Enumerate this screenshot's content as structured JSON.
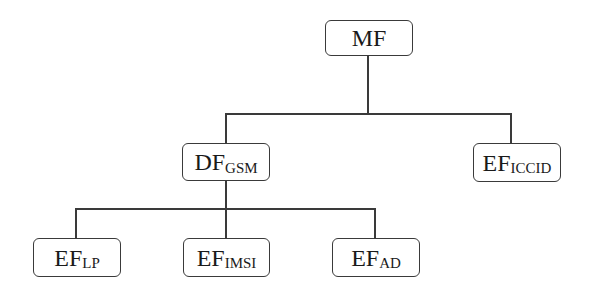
{
  "diagram": {
    "type": "tree",
    "nodes": [
      {
        "id": "mf",
        "main": "MF",
        "sub": ""
      },
      {
        "id": "df_gsm",
        "main": "DF",
        "sub": "GSM"
      },
      {
        "id": "ef_iccid",
        "main": "EF",
        "sub": "ICCID"
      },
      {
        "id": "ef_lp",
        "main": "EF",
        "sub": "LP"
      },
      {
        "id": "ef_imsi",
        "main": "EF",
        "sub": "IMSI"
      },
      {
        "id": "ef_ad",
        "main": "EF",
        "sub": "AD"
      }
    ],
    "edges": [
      [
        "mf",
        "df_gsm"
      ],
      [
        "mf",
        "ef_iccid"
      ],
      [
        "df_gsm",
        "ef_lp"
      ],
      [
        "df_gsm",
        "ef_imsi"
      ],
      [
        "df_gsm",
        "ef_ad"
      ]
    ]
  }
}
